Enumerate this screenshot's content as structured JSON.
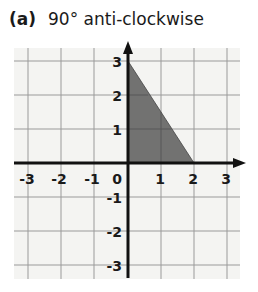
{
  "question": {
    "label": "(a)",
    "text": "90° anti-clockwise"
  },
  "grid": {
    "x_range": [
      -3,
      3
    ],
    "y_range": [
      -3,
      3
    ],
    "x_ticks": [
      "-3",
      "-2",
      "-1",
      "0",
      "1",
      "2",
      "3"
    ],
    "y_ticks": [
      "3",
      "2",
      "1",
      "-1",
      "-2",
      "-3"
    ]
  },
  "shape": {
    "type": "triangle",
    "vertices": [
      [
        0,
        0
      ],
      [
        0,
        3
      ],
      [
        2,
        0
      ]
    ],
    "fill": "#666666"
  },
  "colors": {
    "grid_line": "#9a9a9a",
    "axis": "#111111",
    "background": "#f4f4f2"
  }
}
